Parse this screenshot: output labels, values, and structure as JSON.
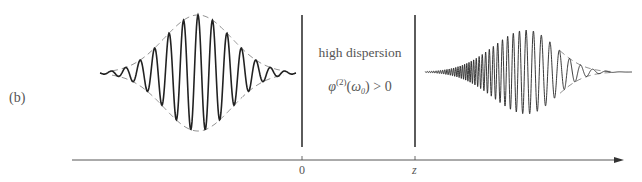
{
  "panel_label": "(b)",
  "medium": {
    "title": "high dispersion",
    "condition": {
      "symbol": "φ",
      "order": "(2)",
      "open": "(",
      "omega": "ω",
      "omega_sub": "0",
      "close": ")",
      "relation": " > 0"
    }
  },
  "axis": {
    "ticks": [
      {
        "label": "0",
        "x": 302
      },
      {
        "label": "z",
        "x": 415
      }
    ],
    "arrow": true
  },
  "pulses": {
    "input": {
      "description": "unchirped Gaussian pulse",
      "center_x": 198,
      "baseline_y": 73,
      "amplitude": 58,
      "width_sigma": 45,
      "cycles_visible": 13
    },
    "output": {
      "description": "positively chirped, broadened pulse",
      "center_x": 527,
      "baseline_y": 72,
      "amplitude": 42,
      "chirp": "frequency increases toward leading (left) side"
    }
  },
  "colors": {
    "line": "#222222",
    "envelope": "#777777",
    "text": "#555555",
    "background": "#ffffff"
  }
}
